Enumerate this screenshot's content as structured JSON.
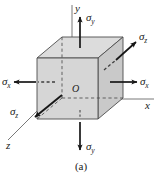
{
  "figure": {
    "caption": "(a)",
    "origin_label": "O",
    "axes": [
      {
        "name": "y-axis",
        "label": "y"
      },
      {
        "name": "x-axis",
        "label": "x"
      },
      {
        "name": "z-axis",
        "label": "z"
      }
    ],
    "stress_labels": [
      {
        "name": "sigma-y-top",
        "symbol": "σ",
        "subscript": "y",
        "direction": "up"
      },
      {
        "name": "sigma-y-bottom",
        "symbol": "σ",
        "subscript": "y",
        "direction": "down"
      },
      {
        "name": "sigma-x-right",
        "symbol": "σ",
        "subscript": "x",
        "direction": "right"
      },
      {
        "name": "sigma-x-left",
        "symbol": "σ",
        "subscript": "x",
        "direction": "left"
      },
      {
        "name": "sigma-z-upper",
        "symbol": "σ",
        "subscript": "z",
        "direction": "up-right"
      },
      {
        "name": "sigma-z-lower",
        "symbol": "σ",
        "subscript": "z",
        "direction": "down-left"
      }
    ],
    "colors": {
      "front_face": "#d6d6d6",
      "top_face": "#dcdcdc",
      "right_face": "#cfcfcf",
      "outline": "#4d4d4d",
      "arrow": "#171717",
      "axis": "#555555",
      "background": "#ffffff"
    }
  }
}
